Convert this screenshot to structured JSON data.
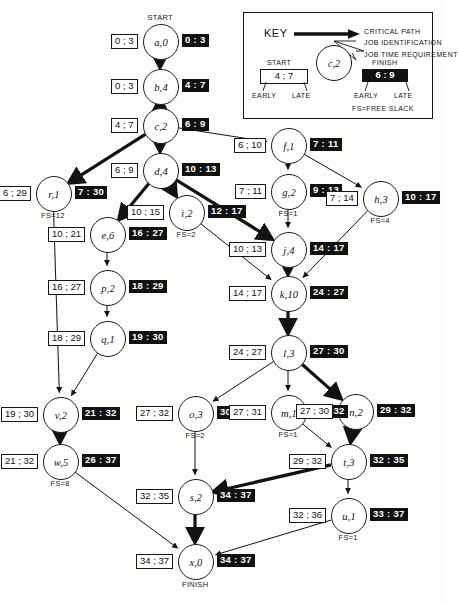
{
  "diagram": {
    "kind": "critical-path-network",
    "start_label": "START",
    "finish_label": "FINISH"
  },
  "key": {
    "title": "KEY",
    "critical_path": "CRITICAL PATH",
    "job_identification": "JOB IDENTIFICATION",
    "job_time_requirement": "JOB TIME REQUIREMENT",
    "start": "START",
    "finish": "FINISH",
    "early_left": "EARLY",
    "late_left": "LATE",
    "early_right": "EARLY",
    "late_right": "LATE",
    "free_slack": "FS=FREE SLACK",
    "sample_node": "c,2",
    "sample_start": "4 ; 7",
    "sample_finish": "6 : 9"
  },
  "nodes": [
    {
      "id": "a",
      "label": "a,0",
      "x": 160,
      "y": 41,
      "start": "0 ; 3",
      "finish": "0 : 3",
      "fs": "",
      "tag": "START"
    },
    {
      "id": "b",
      "label": "b,4",
      "x": 160,
      "y": 86,
      "start": "0 ; 3",
      "finish": "4 : 7",
      "fs": "",
      "tag": ""
    },
    {
      "id": "c",
      "label": "c,2",
      "x": 160,
      "y": 125,
      "start": "4 ; 7",
      "finish": "6 : 9",
      "fs": "",
      "tag": ""
    },
    {
      "id": "f",
      "label": "f,1",
      "x": 288,
      "y": 145,
      "start": "6 ; 10",
      "finish": "7 : 11",
      "fs": "",
      "tag": ""
    },
    {
      "id": "d",
      "label": "d,4",
      "x": 160,
      "y": 170,
      "start": "6 ; 9",
      "finish": "10 : 13",
      "fs": "",
      "tag": ""
    },
    {
      "id": "r",
      "label": "r,1",
      "x": 53,
      "y": 193,
      "start": "6 ; 29",
      "finish": "7 : 30",
      "fs": "FS=12",
      "tag": ""
    },
    {
      "id": "g",
      "label": "g,2",
      "x": 288,
      "y": 191,
      "start": "7 ; 11",
      "finish": "9 : 13",
      "fs": "FS=1",
      "tag": ""
    },
    {
      "id": "h",
      "label": "h,3",
      "x": 380,
      "y": 198,
      "start": "7 ; 14",
      "finish": "10 : 17",
      "fs": "FS=4",
      "tag": ""
    },
    {
      "id": "i",
      "label": "i,2",
      "x": 186,
      "y": 212,
      "start": "10 ; 15",
      "finish": "12 : 17",
      "fs": "FS=2",
      "tag": ""
    },
    {
      "id": "e",
      "label": "e,6",
      "x": 107,
      "y": 234,
      "start": "10 ; 21",
      "finish": "16 : 27",
      "fs": "",
      "tag": ""
    },
    {
      "id": "j",
      "label": "j,4",
      "x": 288,
      "y": 249,
      "start": "10 ; 13",
      "finish": "14 : 17",
      "fs": "",
      "tag": ""
    },
    {
      "id": "p",
      "label": "p,2",
      "x": 107,
      "y": 287,
      "start": "16 ; 27",
      "finish": "18 : 29",
      "fs": "",
      "tag": ""
    },
    {
      "id": "k",
      "label": "k,10",
      "x": 288,
      "y": 293,
      "start": "14 ; 17",
      "finish": "24 : 27",
      "fs": "",
      "tag": ""
    },
    {
      "id": "q",
      "label": "q,1",
      "x": 107,
      "y": 338,
      "start": "18 ; 29",
      "finish": "19 : 30",
      "fs": "",
      "tag": ""
    },
    {
      "id": "l",
      "label": "l,3",
      "x": 288,
      "y": 352,
      "start": "24 ; 27",
      "finish": "27 : 30",
      "fs": "",
      "tag": ""
    },
    {
      "id": "o",
      "label": "o,3",
      "x": 195,
      "y": 413,
      "start": "27 ; 32",
      "finish": "30 : 35",
      "fs": "FS=2",
      "tag": ""
    },
    {
      "id": "m",
      "label": "m,1",
      "x": 288,
      "y": 412,
      "start": "27 ; 31",
      "finish": "28 : 32",
      "fs": "FS=1",
      "tag": ""
    },
    {
      "id": "n",
      "label": "n,2",
      "x": 355,
      "y": 411,
      "start": "27 ; 30",
      "finish": "29 : 32",
      "fs": "",
      "tag": ""
    },
    {
      "id": "v",
      "label": "v,2",
      "x": 60,
      "y": 414,
      "start": "19 ; 30",
      "finish": "21 : 32",
      "fs": "",
      "tag": ""
    },
    {
      "id": "t",
      "label": "t,3",
      "x": 348,
      "y": 461,
      "start": "29 ; 32",
      "finish": "32 : 35",
      "fs": "",
      "tag": ""
    },
    {
      "id": "w",
      "label": "w,5",
      "x": 60,
      "y": 461,
      "start": "21 ; 32",
      "finish": "26 : 37",
      "fs": "FS=8",
      "tag": ""
    },
    {
      "id": "s",
      "label": "s,2",
      "x": 195,
      "y": 496,
      "start": "32 ; 35",
      "finish": "34 : 37",
      "fs": "",
      "tag": ""
    },
    {
      "id": "u",
      "label": "u,1",
      "x": 348,
      "y": 515,
      "start": "32 ; 36",
      "finish": "33 : 37",
      "fs": "FS=1",
      "tag": ""
    },
    {
      "id": "x",
      "label": "x,0",
      "x": 195,
      "y": 561,
      "start": "34 ; 37",
      "finish": "34 : 37",
      "fs": "",
      "tag": "FINISH"
    }
  ],
  "edges": [
    {
      "from": "a",
      "to": "b",
      "critical": true
    },
    {
      "from": "b",
      "to": "c",
      "critical": true
    },
    {
      "from": "c",
      "to": "d",
      "critical": true
    },
    {
      "from": "c",
      "to": "f",
      "critical": false
    },
    {
      "from": "c",
      "to": "r",
      "critical": true
    },
    {
      "from": "d",
      "to": "i",
      "critical": true
    },
    {
      "from": "d",
      "to": "e",
      "critical": true
    },
    {
      "from": "d",
      "to": "j",
      "critical": true
    },
    {
      "from": "f",
      "to": "g",
      "critical": false
    },
    {
      "from": "f",
      "to": "h",
      "critical": false
    },
    {
      "from": "g",
      "to": "j",
      "critical": false
    },
    {
      "from": "h",
      "to": "k",
      "critical": false
    },
    {
      "from": "i",
      "to": "k",
      "critical": false
    },
    {
      "from": "e",
      "to": "p",
      "critical": false
    },
    {
      "from": "p",
      "to": "q",
      "critical": false
    },
    {
      "from": "j",
      "to": "k",
      "critical": true
    },
    {
      "from": "k",
      "to": "l",
      "critical": true
    },
    {
      "from": "r",
      "to": "v",
      "critical": false
    },
    {
      "from": "q",
      "to": "v",
      "critical": false
    },
    {
      "from": "l",
      "to": "o",
      "critical": false
    },
    {
      "from": "l",
      "to": "m",
      "critical": false
    },
    {
      "from": "l",
      "to": "n",
      "critical": true
    },
    {
      "from": "v",
      "to": "w",
      "critical": true
    },
    {
      "from": "m",
      "to": "t",
      "critical": false
    },
    {
      "from": "n",
      "to": "t",
      "critical": true
    },
    {
      "from": "o",
      "to": "s",
      "critical": false
    },
    {
      "from": "t",
      "to": "s",
      "critical": true
    },
    {
      "from": "t",
      "to": "u",
      "critical": false
    },
    {
      "from": "w",
      "to": "x",
      "critical": false
    },
    {
      "from": "s",
      "to": "x",
      "critical": true
    },
    {
      "from": "u",
      "to": "x",
      "critical": false
    }
  ]
}
